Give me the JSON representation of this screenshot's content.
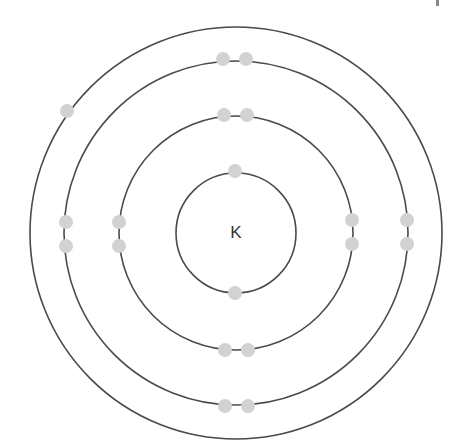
{
  "diagram": {
    "type": "bohr-model",
    "element_symbol": "K",
    "center": [
      236,
      233
    ],
    "colors": {
      "shell_stroke": "#4a4a4a",
      "electron_fill": "#d2d2d2",
      "label": "#333333",
      "background": "#ffffff"
    },
    "electron_radius": 7,
    "shells": [
      {
        "name": "shell-1",
        "radius": 60,
        "electron_count": 2,
        "electrons": [
          [
            235,
            171
          ],
          [
            235,
            293
          ]
        ]
      },
      {
        "name": "shell-2",
        "radius": 117,
        "electron_count": 8,
        "electrons": [
          [
            224,
            115
          ],
          [
            247,
            115
          ],
          [
            119,
            222
          ],
          [
            119,
            246
          ],
          [
            352,
            220
          ],
          [
            352,
            244
          ],
          [
            225,
            350
          ],
          [
            248,
            350
          ]
        ]
      },
      {
        "name": "shell-3",
        "radius": 172,
        "electron_count": 8,
        "electrons": [
          [
            223,
            59
          ],
          [
            246,
            59
          ],
          [
            66,
            222
          ],
          [
            66,
            246
          ],
          [
            407,
            220
          ],
          [
            407,
            244
          ],
          [
            225,
            406
          ],
          [
            248,
            406
          ]
        ]
      },
      {
        "name": "shell-4",
        "radius": 206,
        "electron_count": 1,
        "electrons": [
          [
            67,
            111
          ]
        ]
      }
    ]
  }
}
